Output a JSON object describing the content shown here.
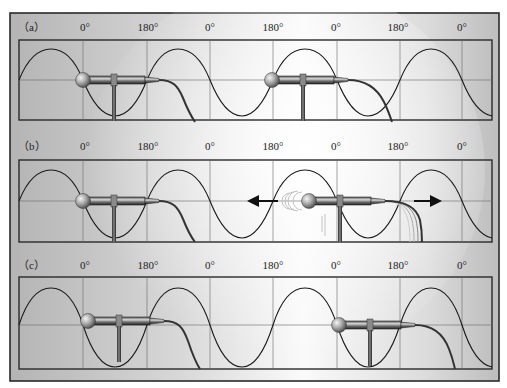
{
  "figure": {
    "panels": [
      {
        "id": "a",
        "label": "（a）",
        "phase_labels": [
          "0°",
          "180°",
          "0°",
          "180°",
          "0°",
          "180°",
          "0°"
        ],
        "mic_left": {
          "position": "0°",
          "state": "static"
        },
        "mic_right": {
          "position": "180°",
          "state": "static"
        }
      },
      {
        "id": "b",
        "label": "（b）",
        "phase_labels": [
          "0°",
          "180°",
          "0°",
          "180°",
          "0°",
          "180°",
          "0°"
        ],
        "mic_left": {
          "position": "0°",
          "state": "static"
        },
        "mic_right": {
          "position": "between 180° and 0°",
          "state": "moving"
        },
        "arrows": [
          "left",
          "right"
        ]
      },
      {
        "id": "c",
        "label": "（c）",
        "phase_labels": [
          "0°",
          "180°",
          "0°",
          "180°",
          "0°",
          "180°",
          "0°"
        ],
        "mic_left": {
          "position": "0°",
          "state": "static"
        },
        "mic_right": {
          "position": "0°",
          "state": "static"
        }
      }
    ]
  },
  "colors": {
    "frame_border": "#2a2a2a",
    "wave": "#1a1a1a",
    "grid": "#6a6a6a",
    "bg_dark": "#b8b8b8",
    "bg_light": "#ffffff",
    "mic_body": "#3a3a3a",
    "mic_head": "#9a9a9a"
  }
}
